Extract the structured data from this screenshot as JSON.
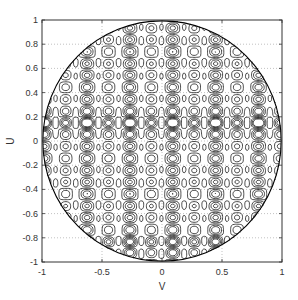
{
  "chart_data": {
    "type": "contour",
    "title": "",
    "xlabel": "V",
    "ylabel": "U",
    "xlim": [
      -1,
      1
    ],
    "ylim": [
      -1,
      1
    ],
    "grid": true,
    "grid_style": "dotted",
    "xticks": [
      -1,
      -0.5,
      0,
      0.5,
      1
    ],
    "xtick_labels": [
      "-1",
      "-0.5",
      "0",
      "0.5",
      "1"
    ],
    "yticks": [
      -1,
      -0.8,
      -0.6,
      -0.4,
      -0.2,
      0,
      0.2,
      0.4,
      0.6,
      0.8,
      1
    ],
    "ytick_labels": [
      "-1",
      "-0.8",
      "-0.6",
      "-0.4",
      "-0.2",
      "0",
      "0.2",
      "0.4",
      "0.6",
      "0.8",
      "1"
    ],
    "domain_shape": "unit circle (v^2 + u^2 <= 1)",
    "line_color": "#000000"
  },
  "colors": {
    "background": "#ffffff",
    "axes": "#333333",
    "grid": "#999999",
    "contour": "#000000"
  }
}
